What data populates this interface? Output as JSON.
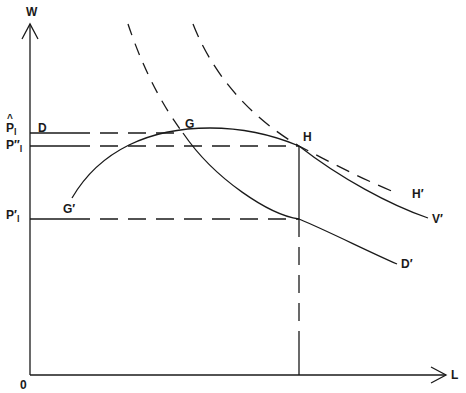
{
  "diagram": {
    "type": "economic-diagram",
    "axes": {
      "y_label": "W",
      "x_label": "L",
      "origin_label": "0"
    },
    "price_levels": [
      {
        "id": "p_hat",
        "label": "P",
        "hat": "^",
        "subscript": "l",
        "line_label": "D",
        "y": 133
      },
      {
        "id": "p_double_prime",
        "label": "P″",
        "subscript": "l",
        "y": 146
      },
      {
        "id": "p_prime",
        "label": "P′",
        "subscript": "l",
        "y": 219
      }
    ],
    "points": [
      {
        "label": "G",
        "x": 183,
        "y": 133
      },
      {
        "label": "H",
        "x": 299,
        "y": 146
      }
    ],
    "curve_end_labels": [
      {
        "label": "G′",
        "curve": "solid concave curve G′–G–H–V′"
      },
      {
        "label": "V′",
        "curve": "solid concave curve G′–G–H–V′"
      },
      {
        "label": "D′",
        "curve": "solid demand curve D–G–D′"
      },
      {
        "label": "H′",
        "curve": "dashed curve through H"
      }
    ],
    "colors": {
      "ink": "#1a1a1a",
      "background": "#ffffff"
    }
  }
}
